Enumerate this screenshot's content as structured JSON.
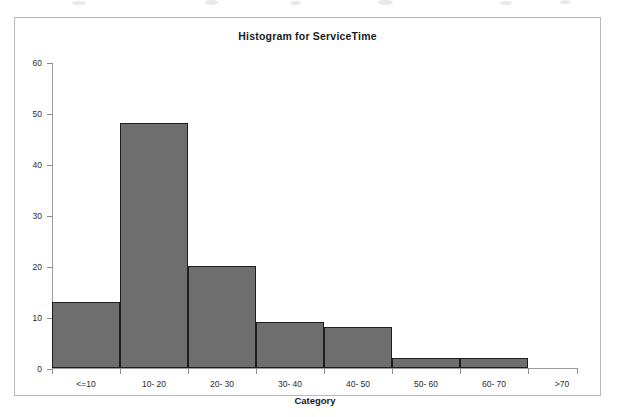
{
  "chart_data": {
    "type": "bar",
    "title": "Histogram for ServiceTime",
    "xlabel": "Category",
    "ylabel": "",
    "categories": [
      "<=10",
      "10- 20",
      "20- 30",
      "30- 40",
      "40- 50",
      "50- 60",
      "60- 70",
      ">70"
    ],
    "values": [
      13,
      48,
      20,
      9,
      8,
      2,
      2,
      0
    ],
    "ylim": [
      0,
      60
    ],
    "yticks": [
      0,
      10,
      20,
      30,
      40,
      50,
      60
    ],
    "ytick_labels": [
      "0",
      "10",
      "20",
      "30",
      "40",
      "50",
      "60"
    ],
    "grid": false,
    "legend": null,
    "bar_color": "#6e6e6e",
    "bar_edge_color": "#1d1d1d",
    "axis_color": "#9c9c9c",
    "frame_color": "#b9b9b9",
    "background": "#ffffff"
  }
}
